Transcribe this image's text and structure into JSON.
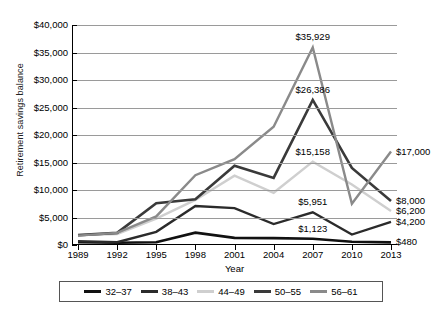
{
  "chart_data": {
    "type": "line",
    "title": "",
    "xlabel": "Year",
    "ylabel": "Retirement savings balance",
    "categories": [
      "1989",
      "1992",
      "1995",
      "1998",
      "2001",
      "2004",
      "2007",
      "2010",
      "2013"
    ],
    "ylim": [
      0,
      40000
    ],
    "ytick_values": [
      0,
      5000,
      10000,
      15000,
      20000,
      25000,
      30000,
      35000,
      40000
    ],
    "ytick_labels": [
      "$0",
      "$5,000",
      "$10,000",
      "$15,000",
      "$20,000",
      "$25,000",
      "$30,000",
      "$35,000",
      "$40,000"
    ],
    "grid": true,
    "legend_position": "bottom",
    "series": [
      {
        "name": "32-37",
        "color": "#111111",
        "width": 2.6,
        "values": [
          500,
          400,
          500,
          2250,
          1300,
          1250,
          1123,
          600,
          480
        ]
      },
      {
        "name": "38-43",
        "color": "#2b2b2b",
        "width": 2.4,
        "values": [
          700,
          500,
          2400,
          7100,
          6700,
          3800,
          5951,
          1900,
          4200
        ]
      },
      {
        "name": "44-49",
        "color": "#cfcfcf",
        "width": 2.4,
        "values": [
          1800,
          2000,
          4800,
          8200,
          12600,
          9500,
          15158,
          11000,
          6200
        ]
      },
      {
        "name": "50-55",
        "color": "#3a3a3a",
        "width": 2.6,
        "values": [
          1800,
          2200,
          7600,
          8300,
          14400,
          12200,
          26386,
          14000,
          8000
        ]
      },
      {
        "name": "56-61",
        "color": "#8a8a8a",
        "width": 2.4,
        "values": [
          1700,
          2200,
          5200,
          12700,
          15600,
          21500,
          35929,
          7500,
          17000
        ]
      }
    ],
    "annotations": [
      {
        "text": "$35,929",
        "series": "56-61",
        "category": "2007",
        "value": 35929,
        "placement": "above"
      },
      {
        "text": "$26,386",
        "series": "50-55",
        "category": "2007",
        "value": 26386,
        "placement": "above"
      },
      {
        "text": "$15,158",
        "series": "44-49",
        "category": "2007",
        "value": 15158,
        "placement": "above"
      },
      {
        "text": "$5,951",
        "series": "38-43",
        "category": "2007",
        "value": 5951,
        "placement": "above"
      },
      {
        "text": "$1,123",
        "series": "32-37",
        "category": "2007",
        "value": 1123,
        "placement": "above"
      },
      {
        "text": "$17,000",
        "series": "56-61",
        "category": "2013",
        "value": 17000,
        "placement": "end"
      },
      {
        "text": "$8,000",
        "series": "50-55",
        "category": "2013",
        "value": 8000,
        "placement": "end"
      },
      {
        "text": "$6,200",
        "series": "44-49",
        "category": "2013",
        "value": 6200,
        "placement": "end"
      },
      {
        "text": "$4,200",
        "series": "38-43",
        "category": "2013",
        "value": 4200,
        "placement": "end"
      },
      {
        "text": "$480",
        "series": "32-37",
        "category": "2013",
        "value": 480,
        "placement": "end"
      }
    ]
  }
}
